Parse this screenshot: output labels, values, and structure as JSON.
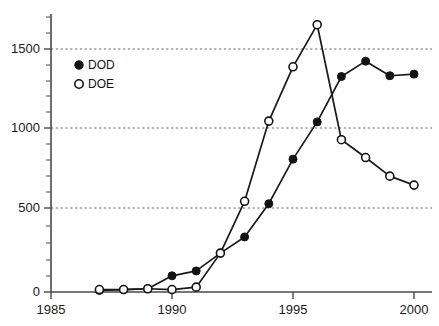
{
  "chart_data": {
    "type": "line",
    "title": "",
    "xlabel": "",
    "ylabel": "",
    "xlim": [
      1985,
      2000.8
    ],
    "ylim": [
      0,
      1700
    ],
    "xticks": [
      1985,
      1990,
      1995,
      2000
    ],
    "xtick_labels": [
      "1985",
      "1990",
      "1995",
      "2000"
    ],
    "yticks": [
      0,
      500,
      1000,
      1500
    ],
    "ytick_labels": [
      "0",
      "500",
      "1000",
      "1500"
    ],
    "y_minor_ticks": [
      100,
      200,
      300,
      400,
      600,
      700,
      800,
      900,
      1100,
      1200,
      1300,
      1400,
      1600
    ],
    "x_minor_ticks": [],
    "grid": "horizontal-dotted-at-major-y",
    "legend_position": "upper-left-inside",
    "x": [
      1987,
      1988,
      1989,
      1990,
      1991,
      1992,
      1993,
      1994,
      1995,
      1996,
      1997,
      1998,
      1999,
      2000
    ],
    "series": [
      {
        "name": "DOD",
        "marker": "filled-circle",
        "color": "#131313",
        "values": [
          10,
          15,
          20,
          100,
          130,
          240,
          340,
          545,
          820,
          1050,
          1330,
          1425,
          1335,
          1345
        ]
      },
      {
        "name": "DOE",
        "marker": "open-circle",
        "color": "#131313",
        "values": [
          15,
          15,
          20,
          15,
          30,
          240,
          560,
          1055,
          1390,
          1650,
          940,
          830,
          715,
          660
        ]
      }
    ],
    "annotations": []
  },
  "legend": {
    "items": [
      {
        "label": "DOD",
        "marker": "filled-circle"
      },
      {
        "label": "DOE",
        "marker": "open-circle"
      }
    ]
  },
  "colors": {
    "axis": "#4a4a4a",
    "grid": "#555555",
    "ink": "#131313",
    "background": "#ffffff"
  }
}
